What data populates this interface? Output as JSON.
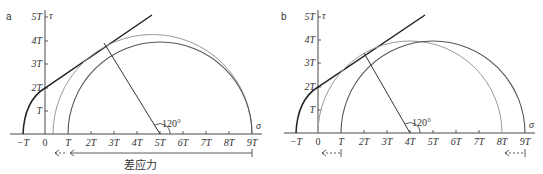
{
  "panels": [
    {
      "label": "a",
      "tau_axis_label": "τ",
      "sigma_axis_label": "σ",
      "tau_ticks": [
        "T",
        "2T",
        "3T",
        "4T",
        "5T"
      ],
      "sigma_ticks": [
        "−T",
        "0",
        "T",
        "2T",
        "3T",
        "4T",
        "5T",
        "6T",
        "7T",
        "8T",
        "9T"
      ],
      "angle_label": "120°",
      "arrow_label": "差应力"
    },
    {
      "label": "b",
      "tau_axis_label": "τ",
      "sigma_axis_label": "σ",
      "tau_ticks": [
        "T",
        "2T",
        "3T",
        "4T",
        "5T"
      ],
      "sigma_ticks": [
        "−T",
        "0",
        "T",
        "2T",
        "3T",
        "4T",
        "5T",
        "6T",
        "7T",
        "8T",
        "9T"
      ],
      "angle_label": "120°"
    }
  ],
  "colors": {
    "ink": "#333333",
    "gray_circle": "#9a9a9a",
    "dark_circle": "#555555"
  }
}
